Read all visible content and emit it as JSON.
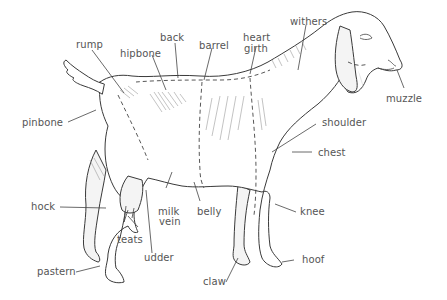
{
  "diagram": {
    "line_color": "#3a3a3a",
    "label_color": "#555555",
    "labels": {
      "rump": "rump",
      "hipbone": "hipbone",
      "back": "back",
      "barrel": "barrel",
      "heart_girth_1": "heart",
      "heart_girth_2": "girth",
      "withers": "withers",
      "muzzle": "muzzle",
      "pinbone": "pinbone",
      "shoulder": "shoulder",
      "chest": "chest",
      "hock": "hock",
      "milk_vein_1": "milk",
      "milk_vein_2": "vein",
      "belly": "belly",
      "knee": "knee",
      "teats": "teats",
      "udder": "udder",
      "pastern": "pastern",
      "claw": "claw",
      "hoof": "hoof"
    }
  }
}
